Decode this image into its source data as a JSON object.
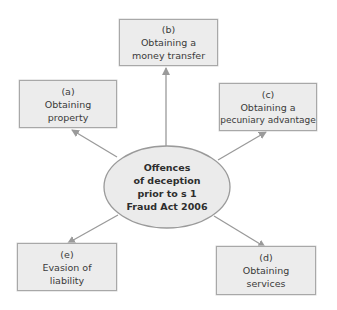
{
  "center": {
    "lines": [
      "Offences",
      "of deception",
      "prior to s 1",
      "Fraud Act 2006"
    ]
  },
  "boxes": {
    "a": {
      "label": "(a)",
      "lines": [
        "Obtaining",
        "property"
      ]
    },
    "b": {
      "label": "(b)",
      "lines": [
        "Obtaining a",
        "money transfer"
      ]
    },
    "c": {
      "label": "(c)",
      "lines": [
        "Obtaining a",
        "pecuniary advantage"
      ]
    },
    "d": {
      "label": "(d)",
      "lines": [
        "Obtaining",
        "services"
      ]
    },
    "e": {
      "label": "(e)",
      "lines": [
        "Evasion of",
        "liability"
      ]
    }
  },
  "colors": {
    "box_fill": "#ececec",
    "box_border": "#a8a8a8",
    "ellipse_fill": "#ebebeb",
    "ellipse_border": "#9a9a9a",
    "arrow": "#9a9a9a"
  }
}
